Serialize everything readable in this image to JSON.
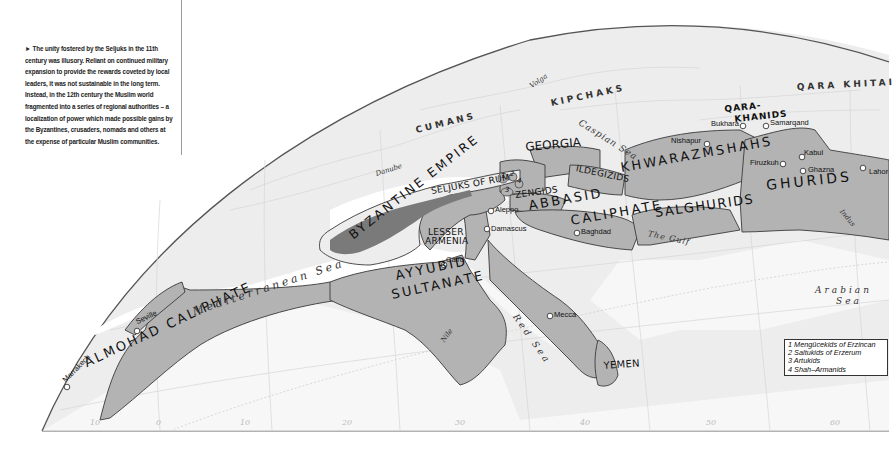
{
  "caption": {
    "marker": "►",
    "text": "The unity fostered by the Seljuks in the 11th century was illusory. Reliant on continued military expansion to provide the rewards coveted by local leaders, it was not sustainable in the long term. Instead, in the 12th century the Muslim world fragmented into a series of regional authorities – a localization of power which made possible gains by the Byzantines, crusaders, nomads and others at the expense of particular Muslim communities."
  },
  "states": {
    "almohad": "ALMOHAD CALIPHATE",
    "byzantine": "BYZANTINE EMPIRE",
    "seljuks_rum": "SELJUKS OF RUM",
    "lesser_armenia_1": "LESSER",
    "lesser_armenia_2": "ARMENIA",
    "ayyubid_1": "AYYUBID",
    "ayyubid_2": "SULTANATE",
    "georgia": "GEORGIA",
    "ildegizids": "ILDEGIZIDS",
    "zengids": "ZENGIDS",
    "abbasid_1": "ABBASID",
    "abbasid_2": "CALIPHATE",
    "khwarazmshahs": "KHWARAZMSHAHS",
    "salghurids": "SALGHURIDS",
    "ghurids": "GHURIDS",
    "qarakhanids_1": "QARA-",
    "qarakhanids_2": "KHANIDS",
    "yemen": "YEMEN",
    "num1": "1",
    "num2": "2",
    "num3": "3",
    "num4": "4"
  },
  "peoples": {
    "cumans": "CUMANS",
    "kipchaks": "KIPCHAKS",
    "qara_khitai": "QARA KHITAI"
  },
  "seas": {
    "mediterranean": "Mediterranean Sea",
    "caspian": "Caspian Sea",
    "red": "Red Sea",
    "gulf": "The Gulf",
    "arabian_1": "Arabian",
    "arabian_2": "Sea"
  },
  "rivers": {
    "danube": "Danube",
    "volga": "Volga",
    "nile": "Nile",
    "indus": "Indus"
  },
  "cities": {
    "seville": "Seville",
    "marrakech": "Marrakech",
    "cairo": "Cairo",
    "damascus": "Damascus",
    "aleppo": "Aleppo",
    "baghdad": "Baghdad",
    "mecca": "Mecca",
    "nishapur": "Nishapur",
    "bukhara": "Bukhara",
    "samarqand": "Samarqand",
    "firuzkuh": "Firuzkuh",
    "kabul": "Kabul",
    "ghazna": "Ghazna",
    "lahore": "Lahor"
  },
  "legend": {
    "items": [
      "1 Mengücekids of Erzincan",
      "2 Saltukids of Erzerum",
      "3 Artukids",
      "4 Shah–Armanids"
    ]
  },
  "graticule": {
    "longitudes": [
      "10",
      "0",
      "10",
      "20",
      "30",
      "40",
      "50",
      "60"
    ]
  },
  "colors": {
    "territory": "#b3b3b3",
    "byzantine_dark": "#7a7a7a",
    "land": "#ececec",
    "water": "#ffffff",
    "border": "#444444"
  }
}
